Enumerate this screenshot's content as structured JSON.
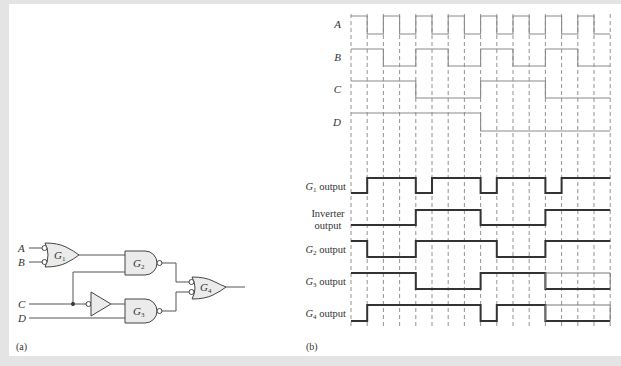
{
  "captions": {
    "a": "(a)",
    "b": "(b)"
  },
  "circuit": {
    "inputs": [
      "A",
      "B",
      "C",
      "D"
    ],
    "gates": [
      {
        "id": "G1",
        "label": "G",
        "sub": "1",
        "type": "OR with inverted inputs (A, B)"
      },
      {
        "id": "G2",
        "label": "G",
        "sub": "2",
        "type": "NAND (G1, C)"
      },
      {
        "id": "G3",
        "label": "G",
        "sub": "3",
        "type": "NAND (inverted C, D)"
      },
      {
        "id": "G4",
        "label": "G",
        "sub": "4",
        "type": "OR with inverted inputs (G2, G3)"
      }
    ],
    "inverter": "buffer with inverted input on C"
  },
  "timing": {
    "intervals": 16,
    "signals": [
      {
        "id": "A",
        "label": "A",
        "levels": [
          1,
          0,
          1,
          0,
          1,
          0,
          1,
          0,
          1,
          0,
          1,
          0,
          1,
          0,
          1,
          0
        ],
        "bold": false
      },
      {
        "id": "B",
        "label": "B",
        "levels": [
          1,
          1,
          0,
          0,
          1,
          1,
          0,
          0,
          1,
          1,
          0,
          0,
          1,
          1,
          0,
          0
        ],
        "bold": false
      },
      {
        "id": "C",
        "label": "C",
        "levels": [
          1,
          1,
          1,
          1,
          0,
          0,
          0,
          0,
          1,
          1,
          1,
          1,
          0,
          0,
          0,
          0
        ],
        "bold": false
      },
      {
        "id": "D",
        "label": "D",
        "levels": [
          1,
          1,
          1,
          1,
          1,
          1,
          1,
          1,
          0,
          0,
          0,
          0,
          0,
          0,
          0,
          0
        ],
        "bold": false
      },
      {
        "id": "G1",
        "label_main": "G",
        "label_sub": "1",
        "label_rest": " output",
        "levels": [
          0,
          1,
          1,
          1,
          0,
          1,
          1,
          1,
          0,
          1,
          1,
          1,
          0,
          1,
          1,
          1
        ],
        "bold": true
      },
      {
        "id": "INV",
        "label_line1": "Inverter",
        "label_line2": "output",
        "levels": [
          0,
          0,
          0,
          0,
          1,
          1,
          1,
          1,
          0,
          0,
          0,
          0,
          1,
          1,
          1,
          1
        ],
        "bold": true
      },
      {
        "id": "G2",
        "label_main": "G",
        "label_sub": "2",
        "label_rest": " output",
        "levels": [
          1,
          0,
          0,
          0,
          1,
          1,
          1,
          1,
          1,
          0,
          0,
          0,
          1,
          1,
          1,
          1
        ],
        "bold": true
      },
      {
        "id": "G3",
        "label_main": "G",
        "label_sub": "3",
        "label_rest": " output",
        "levels": [
          1,
          1,
          1,
          1,
          0,
          0,
          0,
          0,
          1,
          1,
          1,
          1,
          0,
          0,
          0,
          0
        ],
        "bold": true,
        "ghost_high_from": 12
      },
      {
        "id": "G4",
        "label_main": "G",
        "label_sub": "4",
        "label_rest": " output",
        "levels": [
          0,
          1,
          1,
          1,
          1,
          1,
          1,
          1,
          0,
          1,
          1,
          1,
          0,
          0,
          0,
          0
        ],
        "bold": true,
        "ghost_high_from": 12
      }
    ]
  },
  "colors": {
    "panel": "#ffffff",
    "background": "#e4e4e4",
    "gate_fill": "#ebebeb",
    "line": "#555555",
    "bold_line": "#333333",
    "thin_wave": "#8a8a8a"
  }
}
